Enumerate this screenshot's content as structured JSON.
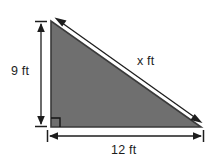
{
  "figure": {
    "type": "right-triangle-diagram",
    "background_color": "#ffffff",
    "fill_color": "#6f6f6f",
    "edge_color": "#3a3a3a",
    "dimension_line_color": "#1d1d1d",
    "text_color": "#1d1d1d",
    "shape": {
      "name": "right-triangle",
      "vertices": [
        {
          "name": "apex-top-left",
          "x": 51,
          "y": 21
        },
        {
          "name": "right-angle-bottom-left",
          "x": 51,
          "y": 127
        },
        {
          "name": "vertex-bottom-right",
          "x": 201,
          "y": 127
        }
      ],
      "right_angle_marker": {
        "at": "bottom-left",
        "size": 9
      }
    },
    "dimensions": [
      {
        "name": "vertical-leg",
        "label": "9 ft",
        "value": 9,
        "unit": "ft",
        "orientation": "vertical",
        "side": "left",
        "arrow_style": "double-arrow-with-end-ticks"
      },
      {
        "name": "hypotenuse",
        "label": "x ft",
        "value": "x",
        "unit": "ft",
        "orientation": "diagonal",
        "side": "upper-right",
        "arrow_style": "double-arrow"
      },
      {
        "name": "horizontal-leg",
        "label": "12 ft",
        "value": 12,
        "unit": "ft",
        "orientation": "horizontal",
        "side": "bottom",
        "arrow_style": "double-arrow-with-end-ticks"
      }
    ]
  }
}
